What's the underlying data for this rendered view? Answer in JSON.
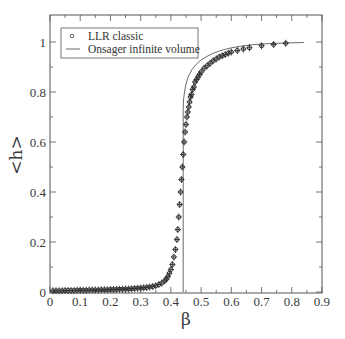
{
  "chart_data": {
    "type": "scatter",
    "title": "",
    "xlabel": "β",
    "ylabel": "<h>",
    "xlim": [
      0,
      0.9
    ],
    "ylim": [
      0,
      1.1
    ],
    "xticks": [
      "0",
      "0.1",
      "0.2",
      "0.3",
      "0.4",
      "0.5",
      "0.6",
      "0.7",
      "0.8",
      "0.9"
    ],
    "yticks": [
      "0",
      "0.2",
      "0.4",
      "0.6",
      "0.8",
      "1"
    ],
    "grid": false,
    "legend_position": "upper-left",
    "legend": [
      {
        "label": "LLR classic",
        "marker": "circle"
      },
      {
        "label": "Onsager infinite volume",
        "marker": "line"
      }
    ],
    "series": [
      {
        "name": "LLR classic",
        "kind": "scatter-errorbars",
        "x": [
          0.01,
          0.02,
          0.03,
          0.04,
          0.05,
          0.06,
          0.07,
          0.08,
          0.09,
          0.1,
          0.11,
          0.12,
          0.13,
          0.14,
          0.15,
          0.16,
          0.17,
          0.18,
          0.19,
          0.2,
          0.21,
          0.22,
          0.23,
          0.24,
          0.25,
          0.26,
          0.27,
          0.28,
          0.29,
          0.3,
          0.31,
          0.32,
          0.33,
          0.34,
          0.35,
          0.36,
          0.37,
          0.38,
          0.385,
          0.39,
          0.395,
          0.4,
          0.405,
          0.41,
          0.415,
          0.42,
          0.423,
          0.426,
          0.429,
          0.432,
          0.435,
          0.438,
          0.441,
          0.444,
          0.447,
          0.45,
          0.453,
          0.456,
          0.459,
          0.462,
          0.465,
          0.468,
          0.472,
          0.476,
          0.48,
          0.485,
          0.49,
          0.495,
          0.5,
          0.51,
          0.52,
          0.53,
          0.54,
          0.55,
          0.56,
          0.57,
          0.58,
          0.59,
          0.6,
          0.62,
          0.64,
          0.66,
          0.7,
          0.74,
          0.78
        ],
        "y": [
          0.005,
          0.005,
          0.005,
          0.005,
          0.006,
          0.006,
          0.006,
          0.006,
          0.007,
          0.007,
          0.007,
          0.007,
          0.008,
          0.008,
          0.008,
          0.008,
          0.009,
          0.009,
          0.009,
          0.01,
          0.01,
          0.01,
          0.011,
          0.011,
          0.012,
          0.012,
          0.013,
          0.014,
          0.015,
          0.016,
          0.017,
          0.018,
          0.02,
          0.022,
          0.025,
          0.03,
          0.036,
          0.045,
          0.052,
          0.062,
          0.075,
          0.09,
          0.11,
          0.14,
          0.17,
          0.21,
          0.25,
          0.3,
          0.35,
          0.4,
          0.45,
          0.5,
          0.55,
          0.6,
          0.64,
          0.67,
          0.7,
          0.72,
          0.74,
          0.76,
          0.78,
          0.79,
          0.81,
          0.82,
          0.84,
          0.85,
          0.86,
          0.87,
          0.88,
          0.895,
          0.905,
          0.915,
          0.925,
          0.932,
          0.94,
          0.945,
          0.95,
          0.955,
          0.96,
          0.966,
          0.972,
          0.977,
          0.985,
          0.99,
          0.995
        ]
      },
      {
        "name": "Onsager infinite volume",
        "kind": "line",
        "x": [
          0.4407,
          0.4407,
          0.4415,
          0.443,
          0.445,
          0.448,
          0.452,
          0.457,
          0.463,
          0.47,
          0.48,
          0.49,
          0.5,
          0.52,
          0.54,
          0.56,
          0.58,
          0.6,
          0.63,
          0.66,
          0.7,
          0.75,
          0.8,
          0.84
        ],
        "y": [
          0,
          0.73,
          0.76,
          0.78,
          0.8,
          0.82,
          0.84,
          0.86,
          0.875,
          0.89,
          0.905,
          0.918,
          0.928,
          0.943,
          0.955,
          0.964,
          0.971,
          0.977,
          0.983,
          0.988,
          0.992,
          0.995,
          0.997,
          0.998
        ]
      }
    ]
  }
}
